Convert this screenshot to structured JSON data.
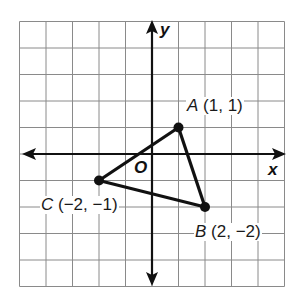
{
  "diagram": {
    "grid": {
      "xmin": -5,
      "xmax": 5,
      "ymin": -5,
      "ymax": 5,
      "origin_px": [
        152,
        154
      ],
      "unit_px": 26.5
    },
    "axes": {
      "x_label": "x",
      "y_label": "y",
      "origin_label": "O"
    },
    "points": [
      {
        "name": "A",
        "x": 1,
        "y": 1,
        "coords": "(1, 1)"
      },
      {
        "name": "B",
        "x": 2,
        "y": -2,
        "coords": "(2, −2)"
      },
      {
        "name": "C",
        "x": -2,
        "y": -1,
        "coords": "(−2, −1)"
      }
    ],
    "colors": {
      "ink": "#111111",
      "grid": "#8a8a8a",
      "background": "#ffffff"
    }
  }
}
